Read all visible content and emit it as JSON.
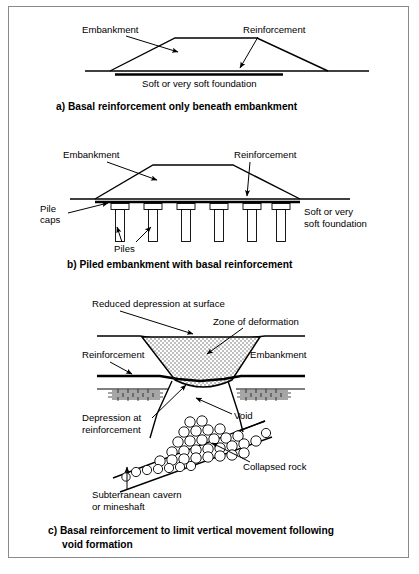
{
  "figure": {
    "border_color": "#8a8a8a",
    "background": "#ffffff",
    "line_color": "#000000"
  },
  "panels": [
    {
      "id": "a",
      "caption": "a) Basal reinforcement only beneath embankment",
      "labels": {
        "embankment": "Embankment",
        "reinforcement": "Reinforcement",
        "foundation": "Soft or very soft foundation"
      }
    },
    {
      "id": "b",
      "caption": "b) Piled embankment with basal reinforcement",
      "labels": {
        "embankment": "Embankment",
        "reinforcement": "Reinforcement",
        "pile_caps_line1": "Pile",
        "pile_caps_line2": "caps",
        "piles": "Piles",
        "foundation_line1": "Soft or very",
        "foundation_line2": "soft foundation"
      },
      "pile_count": 6
    },
    {
      "id": "c",
      "caption_line1": "c) Basal reinforcement to limit vertical movement following",
      "caption_line2": "void formation",
      "labels": {
        "reduced_depression": "Reduced depression at surface",
        "zone_of_deformation": "Zone of deformation",
        "reinforcement": "Reinforcement",
        "embankment": "Embankment",
        "depression_line1": "Depression at",
        "depression_line2": "reinforcement",
        "void": "Void",
        "collapsed_rock": "Collapsed rock",
        "cavern_line1": "Subterranean cavern",
        "cavern_line2": "or mineshaft"
      }
    }
  ]
}
